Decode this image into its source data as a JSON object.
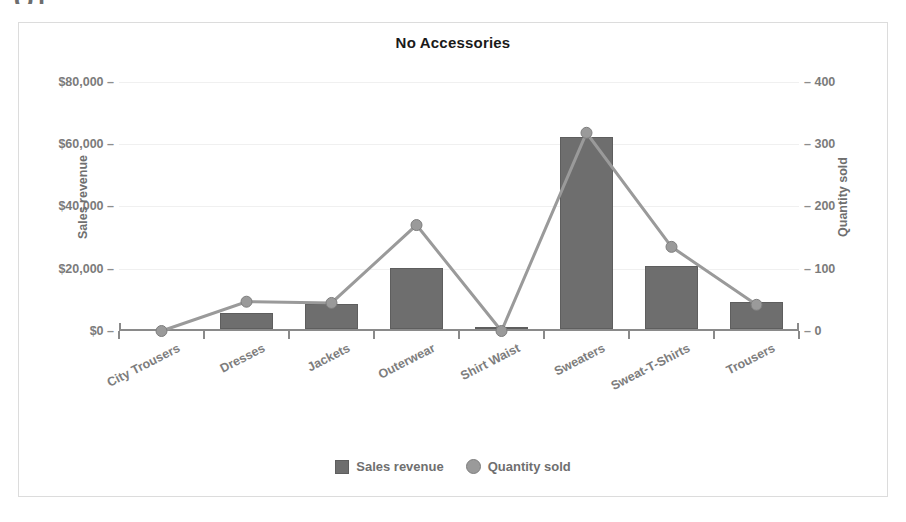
{
  "clipped_header": "Q1",
  "chart_data": {
    "type": "bar",
    "title": "No Accessories",
    "xlabel": "",
    "ylabel": "Sales revenue",
    "y2label": "Quantity sold",
    "grid": true,
    "legend_position": "bottom",
    "categories": [
      "City Trousers",
      "Dresses",
      "Jackets",
      "Outerwear",
      "Shirt Waist",
      "Sweaters",
      "Sweat-T-Shirts",
      "Trousers"
    ],
    "ylim": [
      0,
      86000
    ],
    "y2lim": [
      0,
      430
    ],
    "yticks": [
      0,
      20000,
      40000,
      60000,
      80000
    ],
    "ytick_labels": [
      "$0",
      "$20,000",
      "$40,000",
      "$60,000",
      "$80,000"
    ],
    "y2ticks": [
      0,
      100,
      200,
      300,
      400
    ],
    "y2tick_labels": [
      "0",
      "100",
      "200",
      "300",
      "400"
    ],
    "series": [
      {
        "name": "Sales revenue",
        "type": "bar",
        "axis": "left",
        "color": "#6e6e6e",
        "values": [
          0,
          5200,
          8100,
          19500,
          300,
          61700,
          20200,
          8800
        ]
      },
      {
        "name": "Quantity sold",
        "type": "line",
        "axis": "right",
        "color": "#9a9a9a",
        "values": [
          0,
          47,
          45,
          170,
          0,
          318,
          135,
          42
        ]
      }
    ]
  },
  "legend": {
    "items": [
      {
        "label": "Sales revenue",
        "marker": "square-marker"
      },
      {
        "label": "Quantity sold",
        "marker": "circle-marker"
      }
    ]
  }
}
